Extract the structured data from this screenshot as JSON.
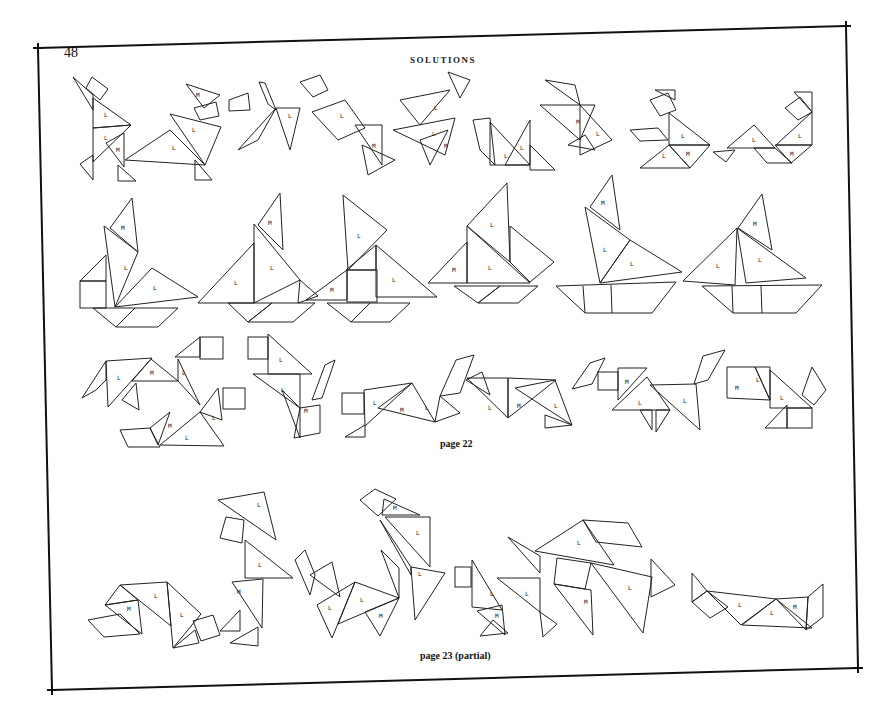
{
  "page": {
    "number": "48",
    "running_header": "SOLUTIONS",
    "captions": {
      "page22": "page 22",
      "page23": "page 23 (partial)"
    },
    "piece_labels": {
      "large": "L",
      "medium": "M"
    },
    "rows": [
      {
        "name": "figures-row-1",
        "count": 8,
        "subject": "human and animal figures"
      },
      {
        "name": "figures-row-2",
        "count": 6,
        "subject": "sailboats"
      },
      {
        "name": "figures-row-3",
        "count": 7,
        "subject": "dogs and animals"
      },
      {
        "name": "figures-row-4",
        "count": 7,
        "subject": "mixed figures and boat"
      }
    ],
    "colors": {
      "ink": "#222222",
      "paper": "#ffffff"
    }
  }
}
